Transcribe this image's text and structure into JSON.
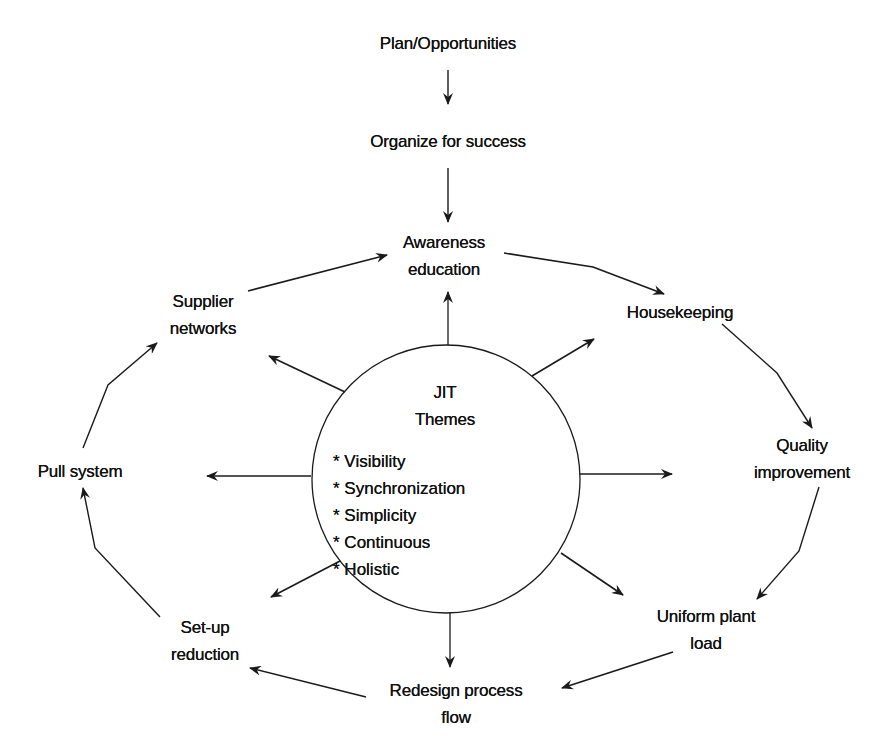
{
  "diagram": {
    "type": "JIT implementation cycle",
    "colors": {
      "ink": "#111111",
      "background": "#ffffff"
    },
    "top_chain": {
      "start": "Plan/Opportunities",
      "second": "Organize for success"
    },
    "center": {
      "title_line1": "JIT",
      "title_line2": "Themes",
      "bullet": "*",
      "themes": [
        "Visibility",
        "Synchronization",
        "Simplicity",
        "Continuous",
        "Holistic"
      ]
    },
    "cycle_nodes": {
      "awareness": {
        "line1": "Awareness",
        "line2": "education"
      },
      "housekeeping": {
        "line1": "Housekeeping"
      },
      "quality": {
        "line1": "Quality",
        "line2": "improvement"
      },
      "uniform": {
        "line1": "Uniform plant",
        "line2": "load"
      },
      "redesign": {
        "line1": "Redesign process",
        "line2": "flow"
      },
      "setup": {
        "line1": "Set-up",
        "line2": "reduction"
      },
      "pull": {
        "line1": "Pull system"
      },
      "supplier": {
        "line1": "Supplier",
        "line2": "networks"
      }
    },
    "cycle_order": [
      "Awareness education",
      "Housekeeping",
      "Quality improvement",
      "Uniform plant load",
      "Redesign process flow",
      "Set-up reduction",
      "Pull system",
      "Supplier networks"
    ]
  }
}
